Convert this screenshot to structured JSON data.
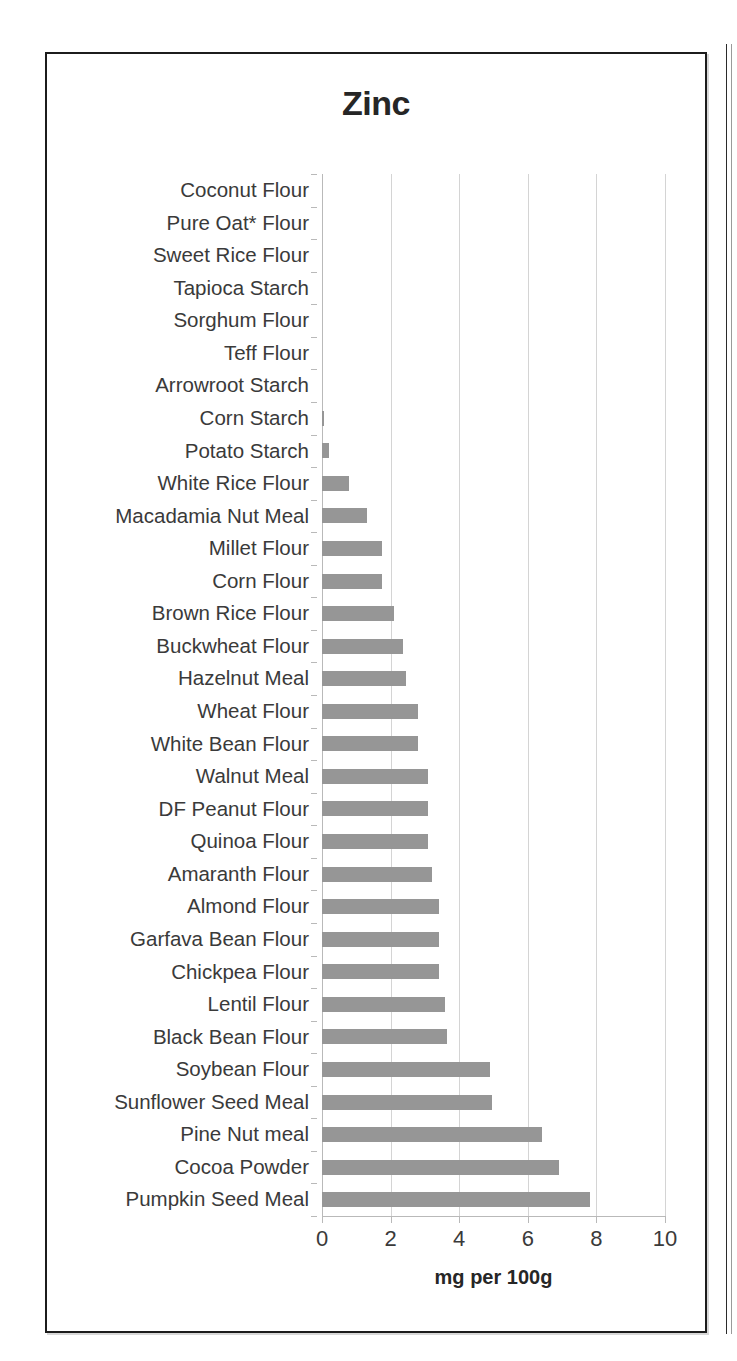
{
  "chart_data": {
    "type": "bar",
    "orientation": "horizontal",
    "title": "Zinc",
    "xlabel": "mg per 100g",
    "ylabel": "",
    "xlim": [
      0,
      10
    ],
    "xticks": [
      0,
      2,
      4,
      6,
      8,
      10
    ],
    "xtick_labels": [
      "0",
      "2",
      "4",
      "6",
      "8",
      "10"
    ],
    "grid": true,
    "legend": false,
    "bar_color": "#969696",
    "categories": [
      "Coconut Flour",
      "Pure Oat* Flour",
      "Sweet Rice Flour",
      "Tapioca Starch",
      "Sorghum Flour",
      "Teff Flour",
      "Arrowroot Starch",
      "Corn Starch",
      "Potato Starch",
      "White Rice Flour",
      "Macadamia Nut Meal",
      "Millet Flour",
      "Corn Flour",
      "Brown Rice Flour",
      "Buckwheat Flour",
      "Hazelnut Meal",
      "Wheat Flour",
      "White Bean Flour",
      "Walnut Meal",
      "DF Peanut Flour",
      "Quinoa Flour",
      "Amaranth Flour",
      "Almond Flour",
      "Garfava Bean Flour",
      "Chickpea Flour",
      "Lentil Flour",
      "Black Bean Flour",
      "Soybean Flour",
      "Sunflower Seed Meal",
      "Pine Nut meal",
      "Cocoa Powder",
      "Pumpkin Seed Meal"
    ],
    "values": [
      0,
      0,
      0,
      0,
      0,
      0,
      0,
      0.05,
      0.2,
      0.8,
      1.3,
      1.75,
      1.75,
      2.1,
      2.35,
      2.45,
      2.8,
      2.8,
      3.1,
      3.1,
      3.1,
      3.2,
      3.4,
      3.4,
      3.4,
      3.6,
      3.65,
      4.9,
      4.95,
      6.4,
      6.9,
      7.8
    ]
  },
  "colors": {
    "bar": "#969696",
    "grid": "#d4d4d4",
    "axis": "#b9b9b9",
    "text": "#3a3a3a",
    "title": "#262626",
    "frame": "#1c1c1c"
  }
}
